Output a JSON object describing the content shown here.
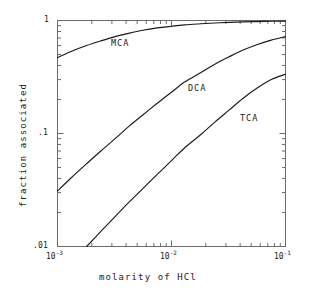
{
  "chart_data": {
    "type": "line",
    "title": "",
    "subtitle": "",
    "xlabel": "molarity of HCl",
    "ylabel": "fraction associated",
    "xscale": "log",
    "yscale": "log",
    "xlim": [
      0.001,
      0.1
    ],
    "ylim": [
      0.01,
      1.0
    ],
    "grid": false,
    "legend": "inline-curve-labels",
    "xticks": [
      {
        "value": 0.001,
        "label": "10",
        "exponent": "-3"
      },
      {
        "value": 0.01,
        "label": "10",
        "exponent": "-2"
      },
      {
        "value": 0.1,
        "label": "10",
        "exponent": "-1"
      }
    ],
    "yticks": [
      {
        "value": 1.0,
        "label": "1"
      },
      {
        "value": 0.1,
        "label": ".1"
      },
      {
        "value": 0.01,
        "label": ".01"
      }
    ],
    "series": [
      {
        "name": "MCA",
        "label": "MCA",
        "color": "#1a1a1a",
        "x": [
          0.001,
          0.0013,
          0.0018,
          0.0024,
          0.0032,
          0.0042,
          0.0056,
          0.0075,
          0.01,
          0.013,
          0.018,
          0.024,
          0.032,
          0.042,
          0.056,
          0.075,
          0.1
        ],
        "y": [
          0.47,
          0.53,
          0.6,
          0.66,
          0.72,
          0.77,
          0.82,
          0.86,
          0.89,
          0.915,
          0.935,
          0.95,
          0.962,
          0.971,
          0.978,
          0.984,
          0.988
        ]
      },
      {
        "name": "DCA",
        "label": "DCA",
        "color": "#1a1a1a",
        "x": [
          0.001,
          0.0013,
          0.0018,
          0.0024,
          0.0032,
          0.0042,
          0.0056,
          0.0075,
          0.01,
          0.013,
          0.018,
          0.024,
          0.032,
          0.042,
          0.056,
          0.075,
          0.1
        ],
        "y": [
          0.031,
          0.04,
          0.054,
          0.07,
          0.09,
          0.115,
          0.146,
          0.185,
          0.232,
          0.285,
          0.345,
          0.41,
          0.477,
          0.545,
          0.61,
          0.67,
          0.72
        ]
      },
      {
        "name": "TCA",
        "label": "TCA",
        "color": "#1a1a1a",
        "x": [
          0.0018,
          0.0024,
          0.0032,
          0.0042,
          0.0056,
          0.0075,
          0.01,
          0.013,
          0.018,
          0.024,
          0.032,
          0.042,
          0.056,
          0.075,
          0.1
        ],
        "y": [
          0.01,
          0.0136,
          0.0184,
          0.0244,
          0.0325,
          0.0435,
          0.0575,
          0.0745,
          0.0975,
          0.126,
          0.161,
          0.203,
          0.251,
          0.3,
          0.335
        ]
      }
    ],
    "annotations": [
      {
        "text": "MCA",
        "x": 0.0032,
        "y": 0.66
      },
      {
        "text": "DCA",
        "x": 0.018,
        "y": 0.28
      },
      {
        "text": "TCA",
        "x": 0.05,
        "y": 0.175
      }
    ]
  },
  "axes": {
    "y_top_label": "1",
    "y_mid_label": ".1",
    "y_bottom_label": ".01",
    "x_left_mantissa": "10",
    "x_left_exponent": "-3",
    "x_mid_mantissa": "10",
    "x_mid_exponent": "-2",
    "x_right_mantissa": "10",
    "x_right_exponent": "-1",
    "x_title": "molarity of HCl",
    "y_title": "fraction associated"
  },
  "style": {
    "background": "#ffffff",
    "axis_color": "#6b6b6b",
    "curve_color": "#1a1a1a",
    "text_color": "#1a1a1a"
  }
}
